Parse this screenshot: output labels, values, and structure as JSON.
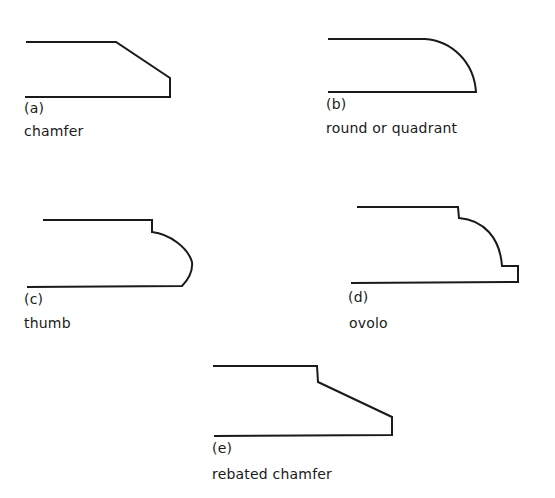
{
  "diagram": {
    "stroke_color": "#1a1a1a",
    "profiles": [
      {
        "id": "a",
        "label": "(a)",
        "name": "chamfer"
      },
      {
        "id": "b",
        "label": "(b)",
        "name": "round or quadrant"
      },
      {
        "id": "c",
        "label": "(c)",
        "name": "thumb"
      },
      {
        "id": "d",
        "label": "(d)",
        "name": "ovolo"
      },
      {
        "id": "e",
        "label": "(e)",
        "name": "rebated chamfer"
      }
    ]
  }
}
